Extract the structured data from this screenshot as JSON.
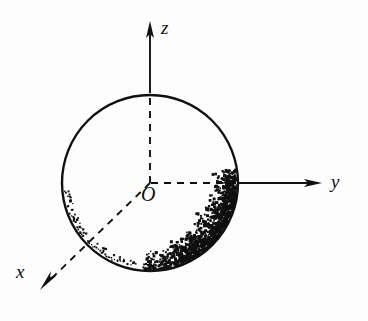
{
  "figure": {
    "title": "",
    "background_color": "#fdfdfd",
    "ink_color": "#101010",
    "width": 368,
    "height": 321
  },
  "labels": {
    "z_axis": "z",
    "y_axis": "y",
    "x_axis": "x",
    "origin": "O"
  },
  "chart_data": {
    "type": "scatter",
    "title": "",
    "xlabel": "y",
    "ylabel": "z",
    "zlabel": "x",
    "grid": false,
    "legend": null,
    "annotations": [
      {
        "text": "z",
        "role": "axis-label",
        "x": 161,
        "y": 18
      },
      {
        "text": "y",
        "role": "axis-label",
        "x": 331,
        "y": 172
      },
      {
        "text": "x",
        "role": "axis-label",
        "x": 16,
        "y": 262
      },
      {
        "text": "O",
        "role": "origin-label",
        "x": 141,
        "y": 184
      }
    ],
    "geometry": {
      "circle": {
        "cx": 150,
        "cy": 183,
        "r": 88,
        "stroke": "#101010",
        "stroke_width": 2.4,
        "fill": "none"
      },
      "axes": [
        {
          "name": "z-axis",
          "from": [
            150,
            183
          ],
          "to": [
            150,
            23
          ],
          "arrow": true,
          "dashed_segment": [
            [
              150,
              183
            ],
            [
              150,
              92
            ]
          ],
          "solid_segment": [
            [
              150,
              92
            ],
            [
              150,
              23
            ]
          ]
        },
        {
          "name": "y-axis",
          "from": [
            150,
            183
          ],
          "to": [
            320,
            183
          ],
          "arrow": true,
          "dashed_segment": [
            [
              150,
              183
            ],
            [
              238,
              183
            ]
          ],
          "solid_segment": [
            [
              238,
              183
            ],
            [
              320,
              183
            ]
          ]
        },
        {
          "name": "x-axis",
          "from": [
            150,
            183
          ],
          "to": [
            42,
            288
          ],
          "arrow": true,
          "dashed_segment": [
            [
              150,
              183
            ],
            [
              42,
              288
            ]
          ],
          "solid_segment": null
        }
      ]
    },
    "scatter_description": {
      "shape": "crescent band hugging the interior of the lower-right arc of the circle",
      "angular_range_deg": [
        -95,
        10
      ],
      "radial_band_fraction": [
        0.62,
        1.0
      ],
      "density_peak_angle_deg": -35,
      "point_count": 1180,
      "point_color": "#101010",
      "point_size_px": 2
    },
    "points_hint": {
      "coordinate_space": "pixels, origin at figure top-left",
      "center": [
        150,
        183
      ],
      "radius": 88
    }
  }
}
